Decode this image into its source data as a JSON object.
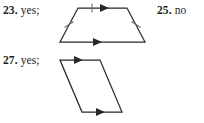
{
  "page": {
    "background_color": "#ffffff",
    "ink_color": "#231f20",
    "line_color": "#2b2728",
    "tick_color": "#6f6b6c"
  },
  "answers": [
    {
      "id": "23",
      "number": "23.",
      "value": "yes;",
      "has_figure": true,
      "figure": {
        "name": "trapezoid",
        "description": "Trapezoid with one pair of parallel sides marked by single arrowheads and congruent legs marked with single tick marks.",
        "vertices": [
          {
            "name": "top-left",
            "x": 26,
            "y": 8
          },
          {
            "name": "top-right",
            "x": 75,
            "y": 8
          },
          {
            "name": "bottom-right",
            "x": 93,
            "y": 42
          },
          {
            "name": "bottom-left",
            "x": 8,
            "y": 42
          }
        ],
        "marks": [
          {
            "type": "arrowhead",
            "edge": "top",
            "direction": "right"
          },
          {
            "type": "arrowhead",
            "edge": "bottom",
            "direction": "right"
          },
          {
            "type": "tick",
            "edge": "top",
            "count": 1
          },
          {
            "type": "tick",
            "edge": "left-leg",
            "count": 1
          },
          {
            "type": "tick",
            "edge": "right-leg",
            "count": 1
          }
        ]
      }
    },
    {
      "id": "25",
      "number": "25.",
      "value": "no",
      "has_figure": false
    },
    {
      "id": "27",
      "number": "27.",
      "value": "yes;",
      "has_figure": true,
      "figure": {
        "name": "slanted-parallelogram",
        "description": "Strongly slanted parallelogram with top and bottom sides marked by single arrowheads indicating they are parallel.",
        "vertices": [
          {
            "name": "top-left",
            "x": 8,
            "y": 8
          },
          {
            "name": "top-right",
            "x": 48,
            "y": 8
          },
          {
            "name": "bottom-right",
            "x": 70,
            "y": 60
          },
          {
            "name": "bottom-left",
            "x": 30,
            "y": 60
          }
        ],
        "marks": [
          {
            "type": "arrowhead",
            "edge": "top",
            "direction": "right"
          },
          {
            "type": "arrowhead",
            "edge": "bottom",
            "direction": "right"
          }
        ]
      }
    }
  ]
}
